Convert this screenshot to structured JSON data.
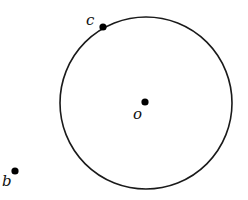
{
  "diagram": {
    "circle": {
      "cx": 146,
      "cy": 103,
      "r": 86,
      "stroke": "#1a1a1a"
    },
    "points": [
      {
        "id": "c",
        "label": "c",
        "x": 103,
        "y": 27,
        "label_x": 86,
        "label_y": 24
      },
      {
        "id": "o",
        "label": "o",
        "x": 145,
        "y": 102,
        "label_x": 133,
        "label_y": 118
      },
      {
        "id": "b",
        "label": "b",
        "x": 15,
        "y": 171,
        "label_x": 2,
        "label_y": 186
      }
    ],
    "point_color": "#000000"
  }
}
